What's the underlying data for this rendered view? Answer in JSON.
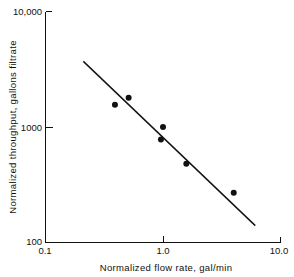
{
  "chart_data": {
    "type": "scatter",
    "title": "",
    "subtitle": "",
    "xlabel": "Normalized flow rate, gal/min",
    "ylabel": "Normalized throughput, gallons filtrate",
    "xscale": "log",
    "yscale": "log",
    "xlim": [
      0.1,
      10.0
    ],
    "ylim": [
      100,
      10000
    ],
    "grid": false,
    "legend": null,
    "xticklabels": [
      "0.1",
      "1.0",
      "10.0"
    ],
    "xticks": [
      0.1,
      1.0,
      10.0
    ],
    "yticklabels": [
      "100",
      "1000",
      "10,000"
    ],
    "yticks": [
      100,
      1000,
      10000
    ],
    "series": [
      {
        "name": "measured data",
        "marker": "filled-circle",
        "color": "#111111",
        "x": [
          0.39,
          0.51,
          0.96,
          1.0,
          1.58,
          4.0
        ],
        "y": [
          1560,
          1790,
          780,
          1000,
          480,
          270
        ]
      },
      {
        "name": "fitted line",
        "type": "line",
        "color": "#111111",
        "x": [
          0.21,
          6.1
        ],
        "y": [
          3700,
          140
        ]
      }
    ],
    "annotations": []
  },
  "axes": {
    "x_axis_title": "Normalized flow rate, gal/min",
    "y_axis_title": "Normalized throughput, gallons filtrate",
    "x_tick_0": "0.1",
    "x_tick_1": "1.0",
    "x_tick_2": "10.0",
    "y_tick_0": "100",
    "y_tick_1": "1000",
    "y_tick_2": "10,000"
  }
}
